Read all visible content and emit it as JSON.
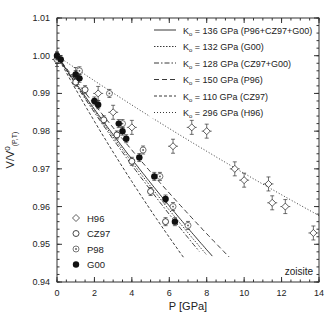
{
  "chart_data": {
    "type": "scatter",
    "title": "",
    "xlabel": "P [GPa]",
    "ylabel": "V/V0(P,T)",
    "xlim": [
      0,
      14
    ],
    "ylim": [
      0.94,
      1.01
    ],
    "xticks": [
      0,
      2,
      4,
      6,
      8,
      10,
      12,
      14
    ],
    "yticks": [
      0.94,
      0.95,
      0.96,
      0.97,
      0.98,
      0.99,
      1.0,
      1.01
    ],
    "ytick_labels": [
      "0.94",
      "0.95",
      "0.96",
      "0.97",
      "0.98",
      "0.99",
      "1.00",
      "1.01"
    ],
    "annotation": "zoisite",
    "fit_lines": [
      {
        "label": "K₀ = 136 GPa (P96+CZ97+G00)",
        "style": "solid",
        "K0": 136,
        "x_end": 8.3
      },
      {
        "label": "K₀ = 132 GPa (G00)",
        "style": "dotted",
        "K0": 132,
        "x_end": 8.0
      },
      {
        "label": "K₀ = 128 GPa (CZ97+G00)",
        "style": "dashdot",
        "K0": 128,
        "x_end": 7.6
      },
      {
        "label": "K₀ = 150 GPa (P96)",
        "style": "dashed",
        "K0": 150,
        "x_end": 9.2
      },
      {
        "label": "K₀ = 110 GPa (CZ97)",
        "style": "shortdash",
        "K0": 110,
        "x_end": 6.8
      },
      {
        "label": "K₀ = 296 GPa (H96)",
        "style": "finedotted",
        "K0": 296,
        "x_end": 14
      }
    ],
    "series": [
      {
        "name": "H96",
        "marker": "diamond-open",
        "x": [
          0.0,
          1.0,
          2.2,
          3.0,
          4.0,
          6.2,
          7.2,
          8.0,
          9.5,
          10.0,
          11.3,
          11.5,
          12.2,
          13.7
        ],
        "y": [
          0.999,
          0.995,
          0.99,
          0.985,
          0.981,
          0.976,
          0.981,
          0.98,
          0.97,
          0.967,
          0.966,
          0.961,
          0.96,
          0.953
        ]
      },
      {
        "name": "CZ97",
        "marker": "circle-open",
        "x": [
          0.0,
          1.0,
          1.5,
          2.5,
          3.2,
          4.0,
          5.0,
          5.8
        ],
        "y": [
          0.999,
          0.993,
          0.991,
          0.983,
          0.979,
          0.972,
          0.964,
          0.956
        ]
      },
      {
        "name": "P98",
        "marker": "circle-dot",
        "x": [
          0.0,
          1.2,
          2.8,
          3.5,
          4.6,
          5.5,
          6.2,
          7.0
        ],
        "y": [
          0.999,
          0.996,
          0.99,
          0.982,
          0.975,
          0.968,
          0.96,
          0.955
        ]
      },
      {
        "name": "G00",
        "marker": "circle-filled",
        "x": [
          0.0,
          0.2,
          1.0,
          1.2,
          2.0,
          2.2,
          3.3,
          3.5,
          3.7,
          4.4,
          5.2,
          5.8,
          6.3
        ],
        "y": [
          1.0,
          0.999,
          0.995,
          0.994,
          0.988,
          0.987,
          0.982,
          0.98,
          0.978,
          0.973,
          0.968,
          0.962,
          0.956
        ]
      }
    ],
    "legend_lines_position": "upper-right",
    "legend_markers_position": "lower-left"
  },
  "ui": {
    "xlabel": "P [GPa]",
    "ylabel_main": "V/V",
    "ylabel_sup": "0",
    "ylabel_sub": "(P,T)",
    "annotation": "zoisite"
  }
}
